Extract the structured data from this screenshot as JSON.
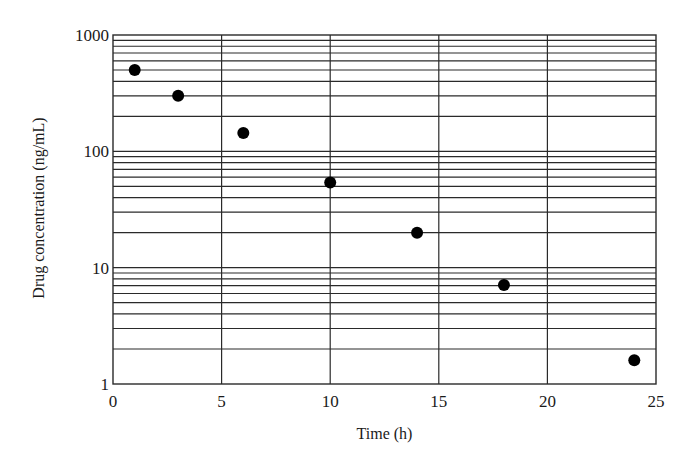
{
  "chart_data": {
    "type": "scatter",
    "title": "",
    "xlabel": "Time (h)",
    "ylabel": "Drug concentration (ng/mL)",
    "xlim": [
      0,
      25
    ],
    "ylim": [
      1,
      1000
    ],
    "yscale": "log",
    "grid": true,
    "legend": null,
    "x_ticks": [
      0,
      5,
      10,
      15,
      20,
      25
    ],
    "x_tick_labels": [
      "0",
      "5",
      "10",
      "15",
      "20",
      "25"
    ],
    "y_ticks": [
      1,
      10,
      100,
      1000
    ],
    "y_tick_labels": [
      "1",
      "10",
      "100",
      "1000"
    ],
    "series": [
      {
        "name": "Drug concentration",
        "x": [
          1,
          3,
          6,
          10,
          14,
          18,
          24
        ],
        "y": [
          500,
          300,
          144,
          54,
          20,
          7.1,
          1.6
        ],
        "marker": "filled-circle",
        "color": "#000000"
      }
    ]
  },
  "style": {
    "grid_color": "#2a2a2a",
    "marker_color": "#000000",
    "background": "#ffffff"
  }
}
